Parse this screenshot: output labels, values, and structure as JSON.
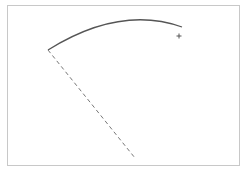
{
  "canvas": {
    "background": "#ffffff",
    "border_color": "#c8c8c8",
    "arc": {
      "start": [
        48,
        50
      ],
      "control": [
        120,
        5
      ],
      "end": [
        182,
        27
      ],
      "color": "#555555",
      "stroke_width": 1.3
    },
    "dashed_line": {
      "start": [
        48,
        50
      ],
      "end": [
        135,
        158
      ],
      "color": "#777777",
      "dash": "4,3"
    },
    "cursor": {
      "type": "crosshair",
      "x": 179,
      "y": 36,
      "color": "#555555"
    }
  }
}
